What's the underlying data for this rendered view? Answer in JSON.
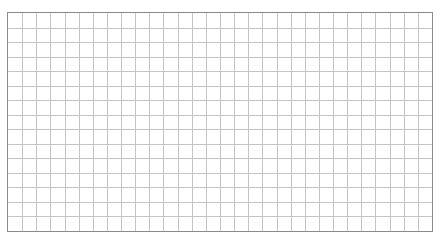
{
  "grid": {
    "columns": 30,
    "rows": 15,
    "line_color": "#c4c4c4",
    "border_color": "#8a8a8a",
    "background": "#ffffff"
  }
}
